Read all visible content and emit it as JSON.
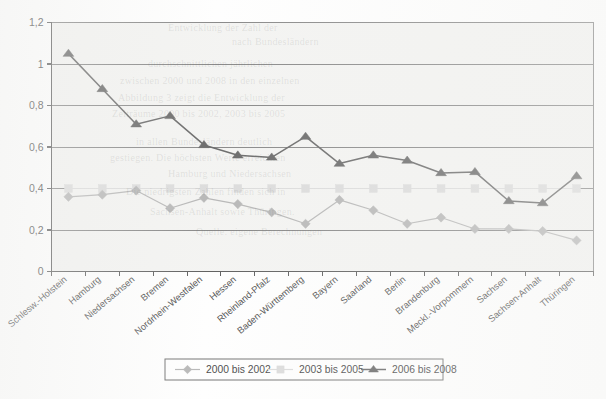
{
  "chart_data": {
    "type": "line",
    "title": "",
    "subtitle": "",
    "xlabel": "",
    "ylabel": "",
    "ylim": [
      0,
      1.2
    ],
    "yticks": [
      0,
      0.2,
      0.4,
      0.6,
      0.8,
      1,
      1.2
    ],
    "ytick_labels": [
      "0",
      "0,2",
      "0,4",
      "0,6",
      "0,8",
      "1",
      "1,2"
    ],
    "grid": true,
    "legend_position": "bottom",
    "categories": [
      "Schlesw.-Holstein",
      "Hamburg",
      "Niedersachsen",
      "Bremen",
      "Nordrhein-Westfalen",
      "Hessen",
      "Rheinland-Pfalz",
      "Baden-Württemberg",
      "Bayern",
      "Saarland",
      "Berlin",
      "Brandenburg",
      "Meckl.-Vorpommern",
      "Sachsen",
      "Sachsen-Anhalt",
      "Thüringen"
    ],
    "series": [
      {
        "name": "2000 bis 2002",
        "marker": "diamond",
        "color": "#a8a8a8",
        "values": [
          0.36,
          0.37,
          0.39,
          0.305,
          0.355,
          0.325,
          0.285,
          0.23,
          0.345,
          0.295,
          0.23,
          0.26,
          0.205,
          0.205,
          0.195,
          0.15
        ]
      },
      {
        "name": "2003 bis 2005",
        "marker": "square",
        "color": "#d5d5d5",
        "values": [
          0.4,
          0.4,
          0.4,
          0.4,
          0.4,
          0.4,
          0.4,
          0.4,
          0.4,
          0.4,
          0.4,
          0.4,
          0.4,
          0.4,
          0.4,
          0.4
        ]
      },
      {
        "name": "2006 bis 2008",
        "marker": "triangle",
        "color": "#4a4a4a",
        "values": [
          1.05,
          0.88,
          0.71,
          0.75,
          0.61,
          0.56,
          0.55,
          0.65,
          0.52,
          0.56,
          0.535,
          0.475,
          0.48,
          0.34,
          0.33,
          0.46
        ]
      }
    ]
  },
  "legend": {
    "items": [
      {
        "label": "2000 bis 2002"
      },
      {
        "label": "2003 bis 2005"
      },
      {
        "label": "2006 bis 2008"
      }
    ]
  },
  "colors": {
    "series_2000_2002": "#a8a8a8",
    "series_2003_2005": "#d5d5d5",
    "series_2006_2008": "#4a4a4a",
    "grid": "#6f6f6f",
    "axis": "#3c3c3c",
    "plot_background": "#f2f2f0"
  },
  "ghost_text": [
    {
      "x": 168,
      "y": 22,
      "text": "Entwicklung der Zahl der"
    },
    {
      "x": 232,
      "y": 36,
      "text": "nach Bundesländern"
    },
    {
      "x": 148,
      "y": 58,
      "text": "durchschnittlichen jährlichen"
    },
    {
      "x": 120,
      "y": 75,
      "text": "zwischen 2000 und 2008 in den einzelnen"
    },
    {
      "x": 118,
      "y": 92,
      "text": "Abbildung 3 zeigt die Entwicklung der"
    },
    {
      "x": 112,
      "y": 108,
      "text": "Zeiträume 2000 bis 2002, 2003 bis 2005"
    },
    {
      "x": 136,
      "y": 136,
      "text": "in allen Bundesländern deutlich"
    },
    {
      "x": 110,
      "y": 152,
      "text": "gestiegen. Die höchsten Werte erreichten"
    },
    {
      "x": 168,
      "y": 168,
      "text": "Hamburg und Niedersachsen"
    },
    {
      "x": 126,
      "y": 186,
      "text": "Die niedrigsten Zahlen finden sich in"
    },
    {
      "x": 150,
      "y": 206,
      "text": "Sachsen-Anhalt sowie Thüringen."
    },
    {
      "x": 196,
      "y": 226,
      "text": "Quelle: eigene Berechnungen"
    }
  ]
}
